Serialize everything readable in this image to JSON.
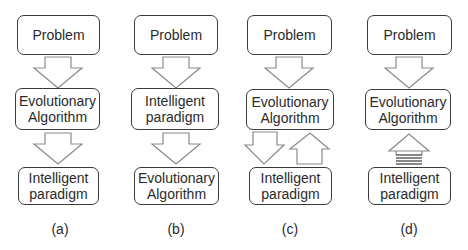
{
  "figure": {
    "panels": [
      {
        "id": "a",
        "label": "(a)",
        "boxes": [
          {
            "lines": [
              "Problem"
            ]
          },
          {
            "lines": [
              "Evolutionary",
              "Algorithm"
            ]
          },
          {
            "lines": [
              "Intelligent",
              "paradigm"
            ]
          }
        ],
        "connections": [
          "down",
          "down"
        ]
      },
      {
        "id": "b",
        "label": "(b)",
        "boxes": [
          {
            "lines": [
              "Problem"
            ]
          },
          {
            "lines": [
              "Intelligent",
              "paradigm"
            ]
          },
          {
            "lines": [
              "Evolutionary",
              "Algorithm"
            ]
          }
        ],
        "connections": [
          "down",
          "down"
        ]
      },
      {
        "id": "c",
        "label": "(c)",
        "boxes": [
          {
            "lines": [
              "Problem"
            ]
          },
          {
            "lines": [
              "Evolutionary",
              "Algorithm"
            ]
          },
          {
            "lines": [
              "Intelligent",
              "paradigm"
            ]
          }
        ],
        "connections": [
          "down",
          "bidirectional (down + up)"
        ]
      },
      {
        "id": "d",
        "label": "(d)",
        "boxes": [
          {
            "lines": [
              "Problem"
            ]
          },
          {
            "lines": [
              "Evolutionary",
              "Algorithm"
            ]
          },
          {
            "lines": [
              "Intelligent",
              "paradigm"
            ]
          }
        ],
        "connections": [
          "down",
          "up (striped)"
        ]
      }
    ]
  },
  "colors": {
    "box_border": "#3a3a3a",
    "arrow_stroke": "#8a8a8a",
    "text": "#2b2b2b",
    "background": "#ffffff"
  }
}
